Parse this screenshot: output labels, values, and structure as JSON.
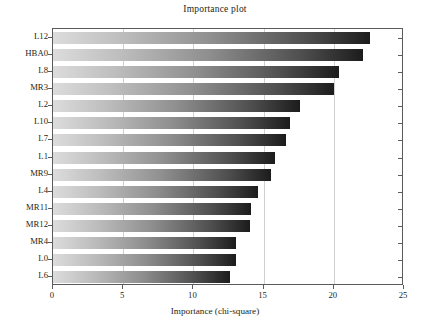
{
  "chart_data": {
    "type": "bar",
    "orientation": "horizontal",
    "title": "Importance plot",
    "xlabel": "Importance (chi-square)",
    "ylabel": "",
    "xlim": [
      0,
      25
    ],
    "xticks": [
      0,
      5,
      10,
      15,
      20,
      25
    ],
    "xtick_labels": [
      "0",
      "5",
      "10",
      "15",
      "20",
      "25"
    ],
    "grid": true,
    "grid_axis": "x",
    "legend": null,
    "categories": [
      "L12",
      "HBA0",
      "L8",
      "MR3",
      "L2",
      "L10",
      "L7",
      "L1",
      "MR9",
      "L4",
      "MR11",
      "MR12",
      "MR4",
      "L0",
      "L6"
    ],
    "values": [
      22.6,
      22.1,
      20.4,
      20.0,
      17.6,
      16.9,
      16.6,
      15.8,
      15.5,
      14.6,
      14.1,
      14.0,
      13.0,
      13.0,
      12.6
    ],
    "bar_gradient": {
      "from": "#dcdcdc",
      "to": "#1c1c1c",
      "direction": "left-to-right"
    },
    "colors": {
      "background": "#ffffff",
      "frame": "#5b5b5b",
      "grid": "#d0d0d0",
      "text": "#231f20"
    }
  }
}
